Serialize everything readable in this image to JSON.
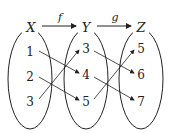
{
  "sets": [
    {
      "label": "X",
      "elements": [
        "1",
        "2",
        "3"
      ]
    },
    {
      "label": "Y",
      "elements": [
        "3",
        "4",
        "5"
      ]
    },
    {
      "label": "Z",
      "elements": [
        "5",
        "6",
        "7"
      ]
    }
  ],
  "functions": [
    {
      "label": "f",
      "from": "X",
      "to": "Y"
    },
    {
      "label": "g",
      "from": "Y",
      "to": "Z"
    }
  ],
  "mappings": {
    "f": [
      [
        "1",
        "4"
      ],
      [
        "2",
        "5"
      ],
      [
        "3",
        "3"
      ]
    ],
    "g": [
      [
        "3",
        "6"
      ],
      [
        "4",
        "7"
      ],
      [
        "5",
        "5"
      ]
    ]
  },
  "colors": {
    "stroke": "#222222",
    "background": "#ffffff"
  }
}
